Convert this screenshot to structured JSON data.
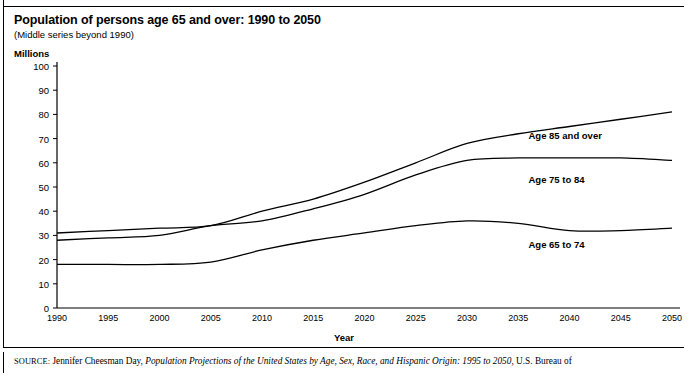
{
  "header": {
    "title": "Population of persons age 65 and over: 1990 to 2050",
    "subtitle": "(Middle series beyond 1990)",
    "units_label": "Millions"
  },
  "source": {
    "label": "SOURCE:",
    "author": " Jennifer Cheesman Day, ",
    "work": "Population Projections of the United States by Age, Sex, Race, and Hispanic Origin: 1995 to 2050",
    "publisher": ", U.S. Bureau of"
  },
  "chart_data": {
    "type": "line",
    "title": "Population of persons age 65 and over: 1990 to 2050",
    "subtitle": "(Middle series beyond 1990)",
    "xlabel": "Year",
    "ylabel": "Millions",
    "xlim": [
      1990,
      2050
    ],
    "ylim": [
      0,
      100
    ],
    "grid": false,
    "legend_position": "inline-right",
    "xticks": [
      1990,
      1995,
      2000,
      2005,
      2010,
      2015,
      2020,
      2025,
      2030,
      2035,
      2040,
      2045,
      2050
    ],
    "yticks": [
      0,
      10,
      20,
      30,
      40,
      50,
      60,
      70,
      80,
      90,
      100
    ],
    "x": [
      1990,
      1995,
      2000,
      2005,
      2010,
      2015,
      2020,
      2025,
      2030,
      2035,
      2040,
      2045,
      2050
    ],
    "series": [
      {
        "name": "Age 85 and over",
        "color": "#000000",
        "values": [
          31,
          32,
          33,
          34,
          40,
          45,
          52,
          60,
          68,
          72,
          75,
          78,
          81
        ],
        "label_x": 2036,
        "label_y": 71
      },
      {
        "name": "Age 75 to 84",
        "color": "#000000",
        "values": [
          28,
          29,
          30,
          34,
          36,
          41,
          47,
          55,
          61,
          62,
          62,
          62,
          61
        ],
        "label_x": 2036,
        "label_y": 53
      },
      {
        "name": "Age 65 to 74",
        "color": "#000000",
        "values": [
          18,
          18,
          18,
          19,
          24,
          28,
          31,
          34,
          36,
          35,
          32,
          32,
          33
        ],
        "label_x": 2036,
        "label_y": 26
      }
    ]
  }
}
